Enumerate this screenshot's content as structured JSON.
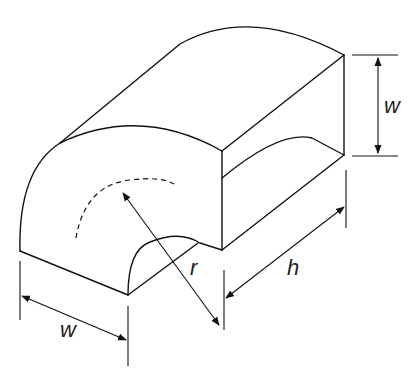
{
  "figure": {
    "stroke_color": "#111111",
    "background": "#ffffff"
  },
  "labels": {
    "width_front": "w",
    "width_side": "w",
    "radius": "r",
    "height": "h"
  }
}
